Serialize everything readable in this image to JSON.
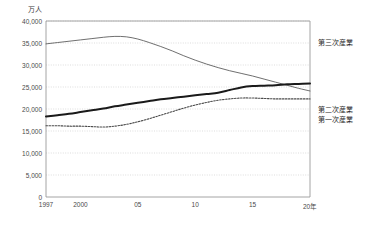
{
  "chart_data": {
    "type": "line",
    "title": "",
    "subtitle": "",
    "unit_label": "万人",
    "xlabel": "",
    "ylabel": "",
    "ylim": [
      0,
      40000
    ],
    "xlim": [
      1997,
      2020
    ],
    "grid": true,
    "grid_axis": "y",
    "legend_position": "right-outside",
    "y_ticks": [
      "0",
      "5,000",
      "10,000",
      "15,000",
      "20,000",
      "25,000",
      "30,000",
      "35,000",
      "40,000"
    ],
    "y_tick_values": [
      0,
      5000,
      10000,
      15000,
      20000,
      25000,
      30000,
      35000,
      40000
    ],
    "x_ticks": [
      "1997",
      "2000",
      "05",
      "10",
      "15",
      "20年"
    ],
    "x_tick_values": [
      1997,
      2000,
      2005,
      2010,
      2015,
      2020
    ],
    "x": [
      1997,
      1998,
      1999,
      2000,
      2001,
      2002,
      2003,
      2004,
      2005,
      2006,
      2007,
      2008,
      2009,
      2010,
      2011,
      2012,
      2013,
      2014,
      2015,
      2016,
      2017,
      2018,
      2019,
      2020
    ],
    "series": [
      {
        "name": "第三次産業",
        "style": "thin-solid",
        "color": "#555555",
        "values": [
          34800,
          35100,
          35400,
          35700,
          36000,
          36300,
          36500,
          36400,
          35900,
          35100,
          34200,
          33200,
          32100,
          31100,
          30200,
          29400,
          28700,
          28100,
          27500,
          26800,
          26100,
          25400,
          24700,
          24100
        ]
      },
      {
        "name": "第二次産業",
        "style": "thick-solid",
        "color": "#1a1a1a",
        "values": [
          18300,
          18600,
          18900,
          19300,
          19700,
          20100,
          20600,
          21000,
          21400,
          21800,
          22200,
          22500,
          22800,
          23100,
          23400,
          23700,
          24300,
          24900,
          25200,
          25300,
          25400,
          25600,
          25700,
          25800
        ]
      },
      {
        "name": "第一次産業",
        "style": "dotted",
        "color": "#4a4a4a",
        "values": [
          16200,
          16200,
          16100,
          16100,
          16000,
          15900,
          16100,
          16500,
          17100,
          17800,
          18600,
          19400,
          20200,
          20900,
          21500,
          22000,
          22300,
          22500,
          22500,
          22400,
          22300,
          22300,
          22300,
          22300
        ]
      }
    ],
    "legend_anchor_values": {
      "第三次産業": 35300,
      "第二次産業": 20000,
      "第一次産業": 17800
    }
  },
  "colors": {
    "axis": "#9a9a9a",
    "grid": "#cfcfcf",
    "text": "#3a3a3a",
    "background": "#ffffff"
  }
}
